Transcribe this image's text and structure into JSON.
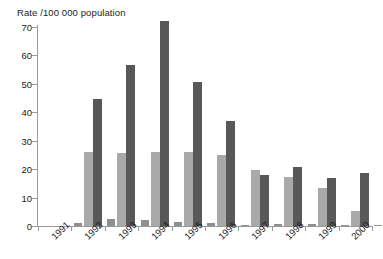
{
  "chart_data": {
    "type": "bar",
    "title": "Rate /100 000 population",
    "xlabel": "",
    "ylabel": "Rate /100 000 population",
    "ylim": [
      0,
      70
    ],
    "yticks": [
      0,
      10,
      20,
      30,
      40,
      50,
      60,
      70
    ],
    "ytick_labels": [
      "0",
      "10",
      "20",
      "30",
      "40",
      "50",
      "60",
      "70"
    ],
    "grid": false,
    "legend": "none",
    "categories": [
      "1991",
      "1992",
      "1993",
      "1994",
      "1995",
      "1996",
      "1997",
      "1998",
      "1999",
      "2000"
    ],
    "series": [
      {
        "name": "series-1",
        "color": "#8f8f8f",
        "values": [
          0.4,
          0.6,
          0.4,
          0.7,
          0.4,
          0.4,
          0.5,
          0.4,
          1.1,
          0.3
        ]
      },
      {
        "name": "series-2",
        "color": "#a9a9a9",
        "values": [
          26.0,
          25.6,
          26.2,
          26.2,
          24.8,
          19.6,
          17.3,
          13.4,
          5.2,
          5.3
        ]
      },
      {
        "name": "series-3",
        "color": "#585858",
        "values": [
          44.5,
          56.8,
          72.2,
          50.8,
          37.0,
          17.8,
          20.7,
          16.9,
          18.8,
          10.7
        ]
      }
    ],
    "series_small_offset": [
      1.1,
      2.6,
      2.0,
      1.5,
      1.2,
      0.4,
      0.6,
      0.6,
      0.5,
      0.4
    ]
  },
  "axis": {
    "title": "Rate /100 000 population"
  }
}
